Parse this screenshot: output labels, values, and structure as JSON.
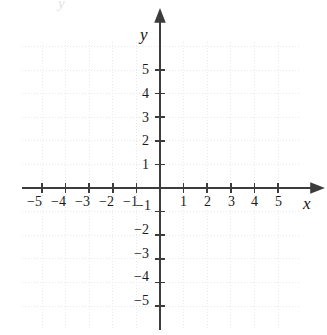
{
  "figure": {
    "kind": "cartesian-coordinate-plane",
    "background_color": "#ffffff",
    "width": 327,
    "height": 335
  },
  "axes": {
    "x_axis_label": "x",
    "y_axis_label": "y",
    "axis_color": "#3c3c3c",
    "grid_color": "#e8e8e8",
    "label_color": "#1a1a1a"
  },
  "top_artifact": {
    "text": "y"
  },
  "chart_data": {
    "type": "scatter",
    "title": "",
    "subtitle": "",
    "xlabel": "x",
    "ylabel": "y",
    "xlim": [
      -5.9,
      6.3
    ],
    "ylim": [
      -6.0,
      7.1
    ],
    "grid": true,
    "grid_style": "dotted",
    "grid_spacing": 1,
    "legend": "none",
    "series": [
      {
        "name": "empty-plot",
        "x": [],
        "y": []
      }
    ],
    "x_ticks": [
      -5,
      -4,
      -3,
      -2,
      -1,
      1,
      2,
      3,
      4,
      5
    ],
    "x_tick_labels": [
      "−5",
      "−4",
      "−3",
      "−2",
      "−1",
      "1",
      "2",
      "3",
      "4",
      "5"
    ],
    "y_ticks": [
      5,
      4,
      3,
      2,
      1,
      -1,
      -2,
      -3,
      -4,
      -5
    ],
    "y_tick_labels": [
      "5",
      "4",
      "3",
      "2",
      "1",
      "−1",
      "−2",
      "−3",
      "−4",
      "−5"
    ],
    "annotations": []
  },
  "geometry": {
    "origin_x": 160,
    "origin_y": 188,
    "unit_px": 23.6,
    "grid_left": 22,
    "grid_right": 301,
    "grid_top": 42,
    "grid_bottom": 328,
    "x_axis_start": 22,
    "x_axis_end": 312,
    "y_axis_top": 21,
    "y_axis_bottom": 330,
    "tick_half_len": 5
  },
  "x_label_positions": [
    {
      "label": "−5",
      "left": 27,
      "top": 195
    },
    {
      "label": "−4",
      "left": 51,
      "top": 195
    },
    {
      "label": "−3",
      "left": 75,
      "top": 195
    },
    {
      "label": "−2",
      "left": 99,
      "top": 195
    },
    {
      "label": "−1",
      "left": 123,
      "top": 195
    },
    {
      "label": "1",
      "left": 180,
      "top": 195
    },
    {
      "label": "2",
      "left": 204,
      "top": 195
    },
    {
      "label": "3",
      "left": 228,
      "top": 195
    },
    {
      "label": "4",
      "left": 251,
      "top": 195
    },
    {
      "label": "5",
      "left": 275,
      "top": 195
    }
  ],
  "y_label_positions": [
    {
      "label": "5",
      "left": 142,
      "top": 63
    },
    {
      "label": "4",
      "left": 142,
      "top": 87
    },
    {
      "label": "3",
      "left": 142,
      "top": 111
    },
    {
      "label": "2",
      "left": 142,
      "top": 134
    },
    {
      "label": "1",
      "left": 142,
      "top": 158
    },
    {
      "label": "−1",
      "left": 136,
      "top": 199
    },
    {
      "label": "−2",
      "left": 134,
      "top": 223
    },
    {
      "label": "−3",
      "left": 134,
      "top": 247
    },
    {
      "label": "−4",
      "left": 134,
      "top": 270
    },
    {
      "label": "−5",
      "left": 134,
      "top": 294
    }
  ],
  "axis_name_positions": {
    "x": {
      "left": 303,
      "top": 195
    },
    "y": {
      "left": 140,
      "top": 26
    }
  }
}
